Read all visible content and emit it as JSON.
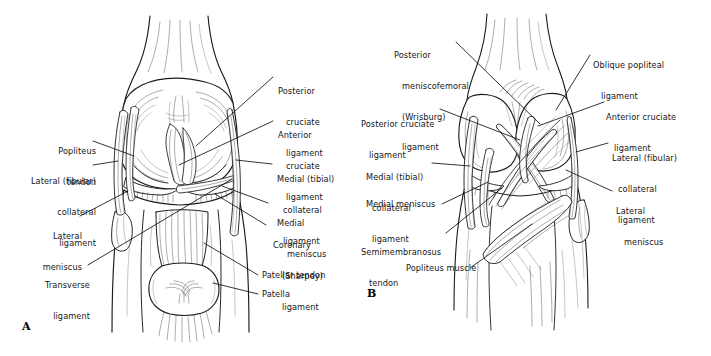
{
  "figure": {
    "background_color": "#ffffff",
    "ink_color": "#1b1b1b",
    "panels": [
      {
        "mark": "A",
        "view": "anterior view of right knee with patella reflected",
        "labels": [
          {
            "id": "popliteus-tendon",
            "text": "Popliteus\ntendon",
            "align": "right"
          },
          {
            "id": "lateral-fibular-collateral-ligament",
            "text": "Lateral (fibular)\ncollateral\nligament",
            "align": "right"
          },
          {
            "id": "lateral-meniscus",
            "text": "Lateral\nmeniscus",
            "align": "right"
          },
          {
            "id": "transverse-ligament",
            "text": "Transverse\nligament",
            "align": "right"
          },
          {
            "id": "posterior-cruciate-ligament",
            "text": "Posterior\ncruciate\nligament",
            "align": "left"
          },
          {
            "id": "anterior-cruciate-ligament",
            "text": "Anterior\ncruciate\nligament",
            "align": "left"
          },
          {
            "id": "medial-tibial-collateral-ligament",
            "text": "Medial (tibial)\ncollateral\nligament",
            "align": "left"
          },
          {
            "id": "medial-meniscus",
            "text": "Medial\nmeniscus",
            "align": "left"
          },
          {
            "id": "coronary-sharpey-ligament",
            "text": "Coronary\n(Sharpey)\nligament",
            "align": "left"
          },
          {
            "id": "patellar-tendon",
            "text": "Patellar tendon",
            "align": "left"
          },
          {
            "id": "patella",
            "text": "Patella",
            "align": "left"
          }
        ]
      },
      {
        "mark": "B",
        "view": "posterior view of right knee",
        "labels": [
          {
            "id": "posterior-meniscofemoral-wrisburg-ligament",
            "text": "Posterior\nmeniscofemoral\n(Wrisburg)\nligament",
            "align": "left"
          },
          {
            "id": "posterior-cruciate-ligament-b",
            "text": "Posterior cruciate\nligament",
            "align": "left"
          },
          {
            "id": "medial-tibial-collateral-ligament-b",
            "text": "Medial (tibial)\ncollateral\nligament",
            "align": "left"
          },
          {
            "id": "medial-meniscus-b",
            "text": "Medial meniscus",
            "align": "left"
          },
          {
            "id": "semimembranosus-tendon",
            "text": "Semimembranosus\ntendon",
            "align": "left"
          },
          {
            "id": "popliteus-muscle",
            "text": "Popliteus muscle",
            "align": "left"
          },
          {
            "id": "oblique-popliteal-ligament",
            "text": "Oblique popliteal\nligament",
            "align": "left"
          },
          {
            "id": "anterior-cruciate-ligament-b",
            "text": "Anterior cruciate\nligament",
            "align": "left"
          },
          {
            "id": "lateral-fibular-collateral-ligament-b",
            "text": "Lateral (fibular)\ncollateral\nligament",
            "align": "left"
          },
          {
            "id": "lateral-meniscus-b",
            "text": "Lateral\nmeniscus",
            "align": "left"
          }
        ]
      }
    ],
    "panel_a_mark": "A",
    "panel_b_mark": "B",
    "labels_a": {
      "popliteus_tendon_l1": "Popliteus",
      "popliteus_tendon_l2": "tendon",
      "lcl_l1": "Lateral (fibular)",
      "lcl_l2": "collateral",
      "lcl_l3": "ligament",
      "lat_men_l1": "Lateral",
      "lat_men_l2": "meniscus",
      "trans_l1": "Transverse",
      "trans_l2": "ligament",
      "pcl_l1": "Posterior",
      "pcl_l2": "cruciate",
      "pcl_l3": "ligament",
      "acl_l1": "Anterior",
      "acl_l2": "cruciate",
      "acl_l3": "ligament",
      "mcl_l1": "Medial (tibial)",
      "mcl_l2": "collateral",
      "mcl_l3": "ligament",
      "med_men_l1": "Medial",
      "med_men_l2": "meniscus",
      "coronary_l1": "Coronary",
      "coronary_l2": "(Sharpey)",
      "coronary_l3": "ligament",
      "patellar_tendon": "Patellar tendon",
      "patella": "Patella"
    },
    "labels_b": {
      "pmf_l1": "Posterior",
      "pmf_l2": "meniscofemoral",
      "pmf_l3": "(Wrisburg)",
      "pmf_l4": "ligament",
      "pcl_l1": "Posterior cruciate",
      "pcl_l2": "ligament",
      "mcl_l1": "Medial (tibial)",
      "mcl_l2": "collateral",
      "mcl_l3": "ligament",
      "med_men": "Medial meniscus",
      "semi_l1": "Semimembranosus",
      "semi_l2": "tendon",
      "popliteus_muscle": "Popliteus muscle",
      "opl_l1": "Oblique popliteal",
      "opl_l2": "ligament",
      "acl_l1": "Anterior cruciate",
      "acl_l2": "ligament",
      "lcl_l1": "Lateral (fibular)",
      "lcl_l2": "collateral",
      "lcl_l3": "ligament",
      "lat_men_l1": "Lateral",
      "lat_men_l2": "meniscus"
    }
  }
}
